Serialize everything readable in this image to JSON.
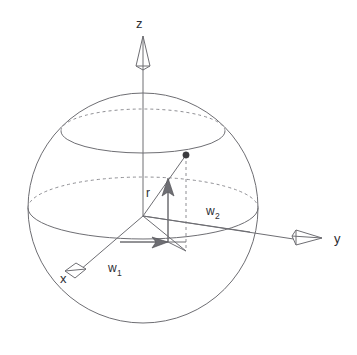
{
  "figure": {
    "background_color": "#ffffff",
    "line_color": "#6e6e73",
    "hidden_line_color": "#8e8e93",
    "label_color": "#2e2e33",
    "point_color": "#3a3a3e"
  },
  "axes": [
    {
      "id": "z",
      "label": "z",
      "icon": "cone-arrow-up-icon",
      "direction": "up"
    },
    {
      "id": "y",
      "label": "y",
      "icon": "cone-arrow-right-icon",
      "direction": "right"
    },
    {
      "id": "x",
      "label": "x",
      "icon": "cone-arrow-foreshortened-icon",
      "direction": "front-left"
    }
  ],
  "vectors": [
    {
      "id": "r",
      "label": "r",
      "sub": "",
      "description": "radial vertical component arrow from origin upward"
    },
    {
      "id": "w1",
      "label": "w",
      "sub": "1",
      "description": "horizontal basis vector arrow pointing right in equatorial plane"
    },
    {
      "id": "w2",
      "label": "w",
      "sub": "2",
      "description": "horizontal basis vector along equatorial plane toward y"
    }
  ],
  "markers": [
    {
      "id": "surface-point",
      "icon": "filled-dot-icon",
      "description": "point on the sphere surface where latitude circle meets the radius line"
    }
  ],
  "curves": [
    {
      "id": "sphere-outline",
      "style": "solid",
      "description": "great circle silhouette of the sphere"
    },
    {
      "id": "equator-front",
      "style": "solid",
      "description": "front half of equatorial circle"
    },
    {
      "id": "equator-back",
      "style": "dashed",
      "description": "hidden back half of equatorial circle"
    },
    {
      "id": "latitude-front",
      "style": "solid",
      "description": "front half of upper latitude circle"
    },
    {
      "id": "latitude-back",
      "style": "dashed",
      "description": "hidden back half of upper latitude circle"
    },
    {
      "id": "projection-line",
      "style": "dashed",
      "description": "vertical dashed drop line from surface point to equatorial plane"
    }
  ]
}
